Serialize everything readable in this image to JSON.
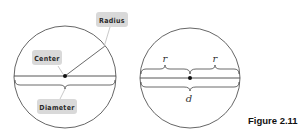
{
  "figure": {
    "caption": "Figure 2.11"
  },
  "left_diagram": {
    "labels": {
      "radius": "Radius",
      "center": "Center",
      "diameter": "Diameter"
    }
  },
  "right_diagram": {
    "labels": {
      "radius_left": "r",
      "radius_right": "r",
      "diameter": "d"
    }
  },
  "colors": {
    "stroke": "#444444",
    "label_background": "#d9d9d9",
    "label_text": "#2a2a2a"
  }
}
